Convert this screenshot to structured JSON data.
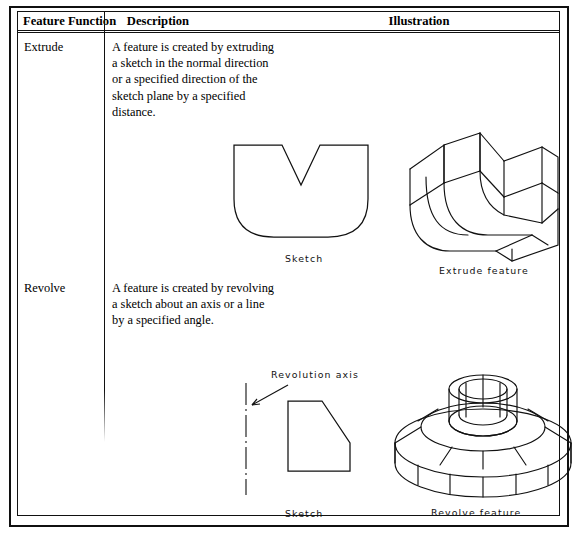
{
  "table": {
    "headers": {
      "col1": "Feature Function",
      "col2": "Description",
      "col3": "Illustration"
    },
    "rows": [
      {
        "name": "Extrude",
        "description_lines": [
          "A feature is created by extruding",
          "a sketch in the normal direction",
          "or a specified direction of the",
          "sketch plane by a specified",
          "distance."
        ],
        "sketch_caption": "Sketch",
        "feature_caption": "Extrude feature"
      },
      {
        "name": "Revolve",
        "description_lines": [
          "A feature is created by revolving",
          "a sketch about an axis or a line",
          "by a specified angle."
        ],
        "axis_label": "Revolution axis",
        "sketch_caption": "Sketch",
        "feature_caption": "Revolve feature"
      }
    ]
  },
  "colors": {
    "line": "#111111",
    "background": "#ffffff"
  }
}
